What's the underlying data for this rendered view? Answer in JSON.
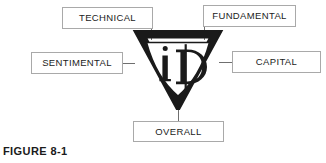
{
  "figure": {
    "caption": "FIGURE 8-1",
    "background_color": "#ffffff",
    "box_border_color": "#a9a9a9",
    "connector_color": "#6f6f6f",
    "text_color": "#1b1b1b",
    "logo_color": "#1a1a1a"
  },
  "center": {
    "name": "id-diamond-logo",
    "shape": "diamond",
    "monogram": "iD"
  },
  "nodes": [
    {
      "id": "technical",
      "label": "TECHNICAL",
      "position": "top-left"
    },
    {
      "id": "fundamental",
      "label": "FUNDAMENTAL",
      "position": "top-right"
    },
    {
      "id": "sentimental",
      "label": "SENTIMENTAL",
      "position": "left"
    },
    {
      "id": "capital",
      "label": "CAPITAL",
      "position": "right"
    },
    {
      "id": "overall",
      "label": "OVERALL",
      "position": "bottom"
    }
  ]
}
